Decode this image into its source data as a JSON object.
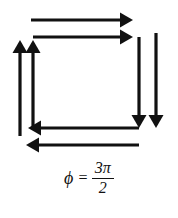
{
  "figure": {
    "background_color": "#ffffff",
    "stroke_color": "#111111",
    "canvas": {
      "width": 178,
      "height": 218
    }
  },
  "label": {
    "name": "phase-label",
    "symbol": "ϕ",
    "equals": "=",
    "numerator": "3π",
    "denominator": "2",
    "full_text": "ϕ = 3π/2"
  },
  "arrows": [
    {
      "id": "arrow-top-outer-right",
      "direction": "right",
      "x1": 31,
      "y1": 20,
      "x2": 133,
      "y2": 20,
      "thickness": 3.2,
      "head_length": 13,
      "head_width": 15
    },
    {
      "id": "arrow-top-inner-right",
      "direction": "right",
      "x1": 33,
      "y1": 37,
      "x2": 133,
      "y2": 37,
      "thickness": 3.2,
      "head_length": 13,
      "head_width": 15
    },
    {
      "id": "arrow-left-outer-up",
      "direction": "up",
      "x1": 20,
      "y1": 136,
      "x2": 20,
      "y2": 40,
      "thickness": 3.2,
      "head_length": 13,
      "head_width": 15
    },
    {
      "id": "arrow-left-inner-up",
      "direction": "up",
      "x1": 33,
      "y1": 128,
      "x2": 33,
      "y2": 40,
      "thickness": 3.2,
      "head_length": 13,
      "head_width": 15
    },
    {
      "id": "arrow-right-inner-down",
      "direction": "down",
      "x1": 139,
      "y1": 37,
      "x2": 139,
      "y2": 128,
      "thickness": 3.2,
      "head_length": 13,
      "head_width": 15
    },
    {
      "id": "arrow-right-outer-down",
      "direction": "down",
      "x1": 156,
      "y1": 33,
      "x2": 156,
      "y2": 128,
      "thickness": 3.2,
      "head_length": 13,
      "head_width": 15
    },
    {
      "id": "arrow-bottom-inner-left",
      "direction": "left",
      "x1": 139,
      "y1": 128,
      "x2": 28,
      "y2": 128,
      "thickness": 3.2,
      "head_length": 13,
      "head_width": 15
    },
    {
      "id": "arrow-bottom-outer-left",
      "direction": "left",
      "x1": 139,
      "y1": 145,
      "x2": 26,
      "y2": 145,
      "thickness": 3.2,
      "head_length": 13,
      "head_width": 15
    }
  ]
}
